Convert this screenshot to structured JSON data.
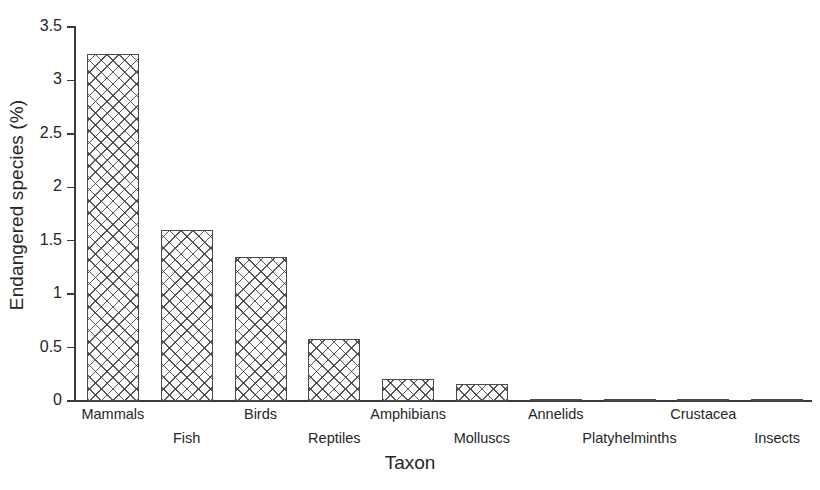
{
  "figure": {
    "background": "#ffffff",
    "ink_color": "#262626",
    "bar_fill": "#fdfdfd",
    "bar_edge": "#4a4a4a"
  },
  "chart_data": {
    "type": "bar",
    "title": "",
    "xlabel": "Taxon",
    "ylabel": "Endangered species (%)",
    "categories": [
      "Mammals",
      "Fish",
      "Birds",
      "Reptiles",
      "Amphibians",
      "Molluscs",
      "Annelids",
      "Platyhelminths",
      "Crustacea",
      "Insects"
    ],
    "values": [
      3.25,
      1.6,
      1.35,
      0.58,
      0.21,
      0.16,
      0.02,
      0.02,
      0.005,
      0.005
    ],
    "ylim": [
      0,
      3.5
    ],
    "xlim_note": "categorical",
    "yticks": [
      0,
      0.5,
      1,
      1.5,
      2,
      2.5,
      3,
      3.5
    ],
    "ytick_labels": [
      "0",
      "0.5",
      "1",
      "1.5",
      "2",
      "2.5",
      "3",
      "3.5"
    ],
    "grid": false,
    "legend": false,
    "bar_pattern": "crosshatch",
    "label_stagger": "alternating two rows below axis"
  }
}
